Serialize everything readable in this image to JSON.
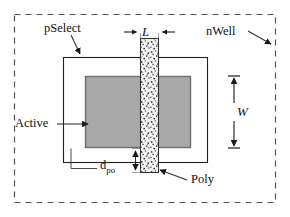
{
  "figure": {
    "kind": "mosfet-layout-diagram"
  },
  "labels": {
    "pselect": "pSelect",
    "nwell": "nWell",
    "active": "Active",
    "poly": "Poly",
    "length": "L",
    "width": "W",
    "dpo_main": "d",
    "dpo_sub": "po"
  },
  "layers": [
    {
      "name": "nWell",
      "style": "dashed-outline",
      "fill": "#ffffff",
      "stroke": "#555555",
      "bounds": {
        "x": 14,
        "y": 14,
        "w": 262,
        "h": 189
      }
    },
    {
      "name": "pSelect",
      "style": "solid-outline",
      "fill": "#ffffff",
      "stroke": "#222222",
      "bounds": {
        "x": 63,
        "y": 57,
        "w": 145,
        "h": 106
      }
    },
    {
      "name": "Active",
      "style": "solid-fill",
      "fill": "#a8a8a8",
      "stroke": "#6f6f6f",
      "bounds": {
        "x": 85,
        "y": 76,
        "w": 106,
        "h": 72
      }
    },
    {
      "name": "Poly",
      "style": "stippled-fill",
      "fill": "#f2f2f2",
      "stroke": "#333333",
      "bounds": {
        "x": 140,
        "y": 38,
        "w": 19,
        "h": 135
      }
    }
  ],
  "dimensions": [
    {
      "name": "L",
      "orientation": "horizontal",
      "label": "L",
      "measures": "poly-width"
    },
    {
      "name": "W",
      "orientation": "vertical",
      "label": "W",
      "measures": "active-height"
    },
    {
      "name": "d_po",
      "orientation": "vertical",
      "label": "d_po",
      "measures": "poly-overhang-below-active"
    }
  ],
  "colors": {
    "active_fill": "#a8a8a8",
    "active_stroke": "#6f6f6f",
    "poly_fill": "#f2f2f2",
    "poly_stroke": "#333333",
    "nwell_stroke": "#555555",
    "pselect_stroke": "#222222",
    "text": "#111111",
    "background": "#ffffff"
  }
}
